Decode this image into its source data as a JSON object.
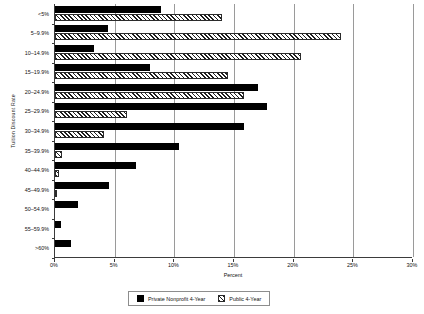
{
  "chart_data": {
    "type": "bar",
    "orientation": "horizontal",
    "title": "",
    "xlabel": "Percent",
    "ylabel": "Tuition Discount Rate",
    "xlim": [
      0,
      30
    ],
    "xticks": [
      0,
      5,
      10,
      15,
      20,
      25,
      30
    ],
    "xtick_labels": [
      "0%",
      "5%",
      "10%",
      "15%",
      "20%",
      "25%",
      "30%"
    ],
    "grid": "vertical",
    "legend_position": "bottom",
    "categories": [
      "<5%",
      "5–9.9%",
      "10–14.9%",
      "15–19.9%",
      "20–24.9%",
      "25–29.9%",
      "30–34.9%",
      "35–39.9%",
      "40–44.9%",
      "45–49.9%",
      "50–54.9%",
      "55–59.9%",
      ">60%"
    ],
    "series": [
      {
        "name": "Private Nonprofit 4-Year",
        "pattern": "solid-black",
        "values": [
          8.9,
          4.4,
          3.3,
          8.0,
          17.0,
          17.8,
          15.8,
          10.4,
          6.8,
          4.5,
          1.9,
          0.5,
          1.3
        ]
      },
      {
        "name": "Public 4-Year",
        "pattern": "diagonal-hatch",
        "values": [
          14.0,
          24.0,
          20.6,
          14.5,
          15.8,
          6.0,
          4.1,
          0.6,
          0.3,
          0.15,
          0.0,
          0.0,
          0.0
        ]
      }
    ]
  },
  "legend": {
    "items": [
      {
        "label": "Private Nonprofit 4-Year",
        "swatch": "solid-black-swatch"
      },
      {
        "label": "Public 4-Year",
        "swatch": "hatched-swatch"
      }
    ]
  },
  "colors": {
    "private_nonprofit": "#000000",
    "public": "#ffffff",
    "hatch_stroke": "#1e1e1e",
    "gridline": "#9a9a9a",
    "axis": "#3b3b3b"
  }
}
